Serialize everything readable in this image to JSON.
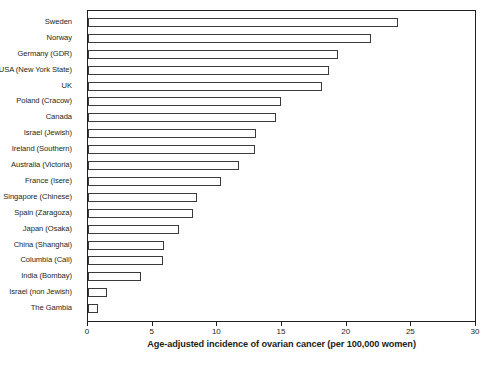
{
  "chart_data": {
    "type": "bar",
    "orientation": "horizontal",
    "title": "",
    "xlabel": "Age-adjusted incidence of ovarian cancer (per 100,000 women)",
    "ylabel": "",
    "xlim": [
      0,
      30
    ],
    "xticks": [
      0,
      5,
      10,
      15,
      20,
      25,
      30
    ],
    "xtick_labels": [
      "0",
      "5",
      "10",
      "15",
      "20",
      "25",
      "30"
    ],
    "grid": false,
    "legend": false,
    "categories": [
      "Sweden",
      "Norway",
      "Germany (GDR)",
      "USA (New York State)",
      "UK",
      "Poland (Cracow)",
      "Canada",
      "Israel (Jewish)",
      "Ireland (Southern)",
      "Australia (Victoria)",
      "France (Isere)",
      "Singapore (Chinese)",
      "Spain (Zaragoza)",
      "Japan (Osaka)",
      "China (Shanghai)",
      "Columbia (Cali)",
      "India (Bombay)",
      "Israel (non Jewish)",
      "The Gambia"
    ],
    "values": [
      24.0,
      21.9,
      19.3,
      18.6,
      18.1,
      14.9,
      14.5,
      13.0,
      12.9,
      11.7,
      10.3,
      8.4,
      8.1,
      7.0,
      5.9,
      5.8,
      4.1,
      1.5,
      0.8
    ],
    "colors": {
      "bar_fill": "#ffffff",
      "bar_edge": "#3a3a3c",
      "axis": "#231f20",
      "text": "#231f20",
      "background": "#ffffff"
    }
  }
}
